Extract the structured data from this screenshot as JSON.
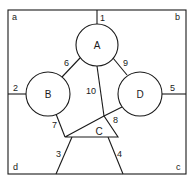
{
  "diagram": {
    "frame": {
      "x": 8,
      "y": 10,
      "width": 178,
      "height": 164
    },
    "corners": [
      {
        "id": "a",
        "label": "a",
        "x": 12,
        "y": 20
      },
      {
        "id": "b",
        "label": "b",
        "x": 175,
        "y": 20
      },
      {
        "id": "c",
        "label": "c",
        "x": 176,
        "y": 170
      },
      {
        "id": "d",
        "label": "d",
        "x": 13,
        "y": 170
      }
    ],
    "nodes": [
      {
        "id": "A",
        "label": "A",
        "shape": "circle",
        "cx": 97,
        "cy": 45,
        "r": 21
      },
      {
        "id": "B",
        "label": "B",
        "shape": "circle",
        "cx": 48,
        "cy": 94,
        "r": 22
      },
      {
        "id": "D",
        "label": "D",
        "shape": "circle",
        "cx": 140,
        "cy": 94,
        "r": 22
      },
      {
        "id": "C",
        "label": "C",
        "shape": "triangle",
        "points": "65,137 104,116 118,137",
        "lx": 99,
        "ly": 131
      }
    ],
    "edges": [
      {
        "id": "1",
        "label": "1",
        "x1": 97,
        "y1": 10,
        "x2": 97,
        "y2": 24,
        "lx": 100,
        "ly": 21
      },
      {
        "id": "2",
        "label": "2",
        "x1": 8,
        "y1": 94,
        "x2": 26,
        "y2": 94,
        "lx": 13,
        "ly": 91
      },
      {
        "id": "3",
        "label": "3",
        "x1": 72,
        "y1": 137,
        "x2": 56,
        "y2": 174,
        "lx": 56,
        "ly": 157
      },
      {
        "id": "4",
        "label": "4",
        "x1": 108,
        "y1": 137,
        "x2": 123,
        "y2": 174,
        "lx": 117,
        "ly": 157
      },
      {
        "id": "5",
        "label": "5",
        "x1": 162,
        "y1": 94,
        "x2": 186,
        "y2": 94,
        "lx": 170,
        "ly": 91
      },
      {
        "id": "6",
        "label": "6",
        "x1": 80,
        "y1": 58,
        "x2": 62,
        "y2": 77,
        "lx": 64,
        "ly": 66
      },
      {
        "id": "7",
        "label": "7",
        "x1": 56,
        "y1": 114,
        "x2": 65,
        "y2": 137,
        "lx": 52,
        "ly": 128
      },
      {
        "id": "8",
        "label": "8",
        "x1": 104,
        "y1": 116,
        "x2": 122,
        "y2": 107,
        "lx": 113,
        "ly": 123
      },
      {
        "id": "9",
        "label": "9",
        "x1": 113,
        "y1": 58,
        "x2": 127,
        "y2": 75,
        "lx": 123,
        "ly": 66
      },
      {
        "id": "10",
        "label": "10",
        "x1": 97,
        "y1": 66,
        "x2": 104,
        "y2": 116,
        "lx": 86,
        "ly": 94
      }
    ]
  }
}
